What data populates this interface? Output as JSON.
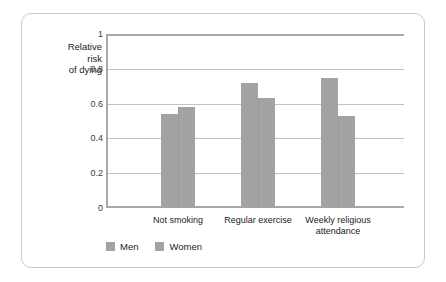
{
  "chart_data": {
    "type": "bar",
    "title": "",
    "subtitle": "",
    "xlabel": "",
    "ylabel": "Relative\nrisk\nof dying",
    "categories": [
      "Not smoking",
      "Regular exercise",
      "Weekly religious\nattendance"
    ],
    "series": [
      {
        "name": "Men",
        "values": [
          0.54,
          0.72,
          0.75
        ]
      },
      {
        "name": "Women",
        "values": [
          0.58,
          0.63,
          0.53
        ]
      }
    ],
    "ylim": [
      0,
      1
    ],
    "ytick_labels": [
      "1",
      "0.8",
      "0.6",
      "0.4",
      "0.2",
      "0"
    ],
    "ytick_values": [
      1,
      0.8,
      0.6,
      0.4,
      0.2,
      0
    ],
    "grid": true,
    "legend_position": "bottom-left",
    "bar_color": "#a3a3a3",
    "grid_color": "#c2c2c2",
    "axis_color": "#a8a8a8",
    "frame_color": "#c9c9c9",
    "text_color": "#1c1c1c"
  }
}
